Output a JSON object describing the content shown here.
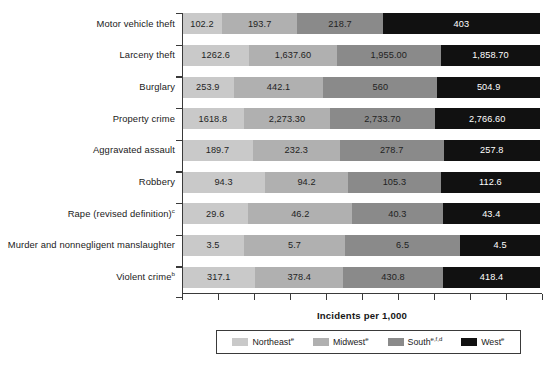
{
  "chart_data": {
    "type": "bar",
    "subtype": "stacked-horizontal",
    "title": "",
    "xlabel": "Incidents per 1,000",
    "ylabel": "",
    "grid": false,
    "legend_position": "bottom",
    "axis": {
      "x_tick_count": 10,
      "x_tick_labels": [],
      "y_tick_marks_between_rows": true
    },
    "categories": [
      "Motor vehicle theft",
      "Larceny theft",
      "Burglary",
      "Property crime",
      "Aggravated assault",
      "Robbery",
      "Rape (revised definition)",
      "Murder and nonnegligent manslaughter",
      "Violent crime"
    ],
    "category_footnotes": [
      "",
      "",
      "",
      "",
      "",
      "",
      "c",
      "",
      "b"
    ],
    "series": [
      {
        "name": "Northeast",
        "footnote": "e",
        "color": "#c9c9c9",
        "values": [
          102.2,
          1262.6,
          253.9,
          1618.8,
          189.7,
          94.3,
          29.6,
          3.5,
          317.1
        ],
        "labels": [
          "102.2",
          "1262.6",
          "253.9",
          "1618.8",
          "189.7",
          "94.3",
          "29.6",
          "3.5",
          "317.1"
        ]
      },
      {
        "name": "Midwest",
        "footnote": "e",
        "color": "#b0b0b0",
        "values": [
          193.7,
          1637.6,
          442.1,
          2273.3,
          232.3,
          94.2,
          46.2,
          5.7,
          378.4
        ],
        "labels": [
          "193.7",
          "1,637.60",
          "442.1",
          "2,273.30",
          "232.3",
          "94.2",
          "46.2",
          "5.7",
          "378.4"
        ]
      },
      {
        "name": "South",
        "footnote": "e,f,d",
        "color": "#8a8a8a",
        "values": [
          218.7,
          1955.0,
          560.0,
          2733.7,
          278.7,
          105.3,
          40.3,
          6.5,
          430.8
        ],
        "labels": [
          "218.7",
          "1,955.00",
          "560",
          "2,733.70",
          "278.7",
          "105.3",
          "40.3",
          "6.5",
          "430.8"
        ]
      },
      {
        "name": "West",
        "footnote": "e",
        "color": "#111111",
        "values": [
          403.0,
          1858.7,
          504.9,
          2766.6,
          257.8,
          112.6,
          43.4,
          4.5,
          418.4
        ],
        "labels": [
          "403",
          "1,858.70",
          "504.9",
          "2,766.60",
          "257.8",
          "112.6",
          "43.4",
          "4.5",
          "418.4"
        ]
      }
    ]
  },
  "legend": {
    "items": [
      {
        "label": "Northeast",
        "footnote": "e",
        "color": "#c9c9c9"
      },
      {
        "label": "Midwest",
        "footnote": "e",
        "color": "#b0b0b0"
      },
      {
        "label": "South",
        "footnote": "e,f,d",
        "color": "#8a8a8a"
      },
      {
        "label": "West",
        "footnote": "e",
        "color": "#111111"
      }
    ]
  }
}
